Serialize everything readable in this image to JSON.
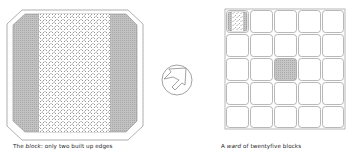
{
  "figures": [
    {
      "id": "block",
      "caption_prefix": "The ",
      "caption_emph": "block",
      "caption_rest": ": only two built up edges"
    },
    {
      "id": "transition",
      "symbol": "arrow-in-circle-icon"
    },
    {
      "id": "ward",
      "caption_prefix": "A ",
      "caption_emph": "ward",
      "caption_rest": " of twentyfive blocks",
      "grid": {
        "rows": 5,
        "cols": 5,
        "highlighted_cells": [
          {
            "row": 0,
            "col": 0,
            "type": "block-detail"
          },
          {
            "row": 2,
            "col": 2,
            "type": "shaded"
          }
        ]
      }
    }
  ],
  "colors": {
    "outline": "#9a9a9a",
    "built_edge": "#b5b5b5",
    "hatch": "#8a8a8a",
    "background": "#ffffff"
  }
}
